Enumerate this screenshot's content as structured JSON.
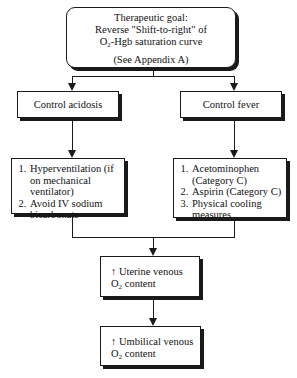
{
  "diagram": {
    "goal": {
      "line1": "Therapeutic goal:",
      "line2": "Reverse \"Shift-to-right\" of",
      "line3_prefix": "O",
      "line3_sub": "2",
      "line3_suffix": "-Hgb saturation curve",
      "note": "(See  Appendix A)"
    },
    "branches": [
      {
        "label": "Control acidosis",
        "actions": [
          "Hyperventilation (if on mechanical ventilator)",
          "Avoid IV sodium bicarbonate"
        ]
      },
      {
        "label": "Control fever",
        "actions": [
          "Acetominophen (Category C)",
          "Aspirin (Category C)",
          "Physical cooling measures"
        ]
      }
    ],
    "outcomes": [
      {
        "arrow": "↑",
        "line1": " Uterine venous",
        "line2_prefix": "O",
        "line2_sub": "2",
        "line2_suffix": " content"
      },
      {
        "arrow": "↑",
        "line1": " Umbilical venous",
        "line2_prefix": "O",
        "line2_sub": "2",
        "line2_suffix": " content"
      }
    ]
  }
}
